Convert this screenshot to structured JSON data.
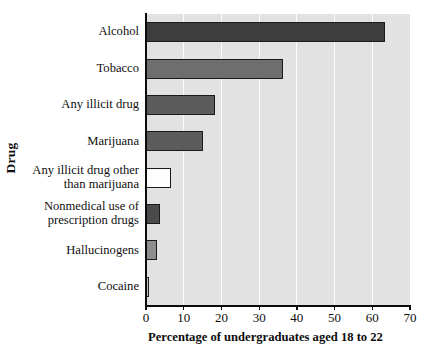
{
  "chart_data": {
    "type": "bar",
    "orientation": "horizontal",
    "title": "",
    "xlabel": "Percentage of undergraduates aged 18 to 22",
    "ylabel": "Drug",
    "xlim": [
      0,
      70
    ],
    "xticks": [
      0,
      10,
      20,
      30,
      40,
      50,
      60,
      70
    ],
    "xtick_labels": [
      "0",
      "10",
      "20",
      "30",
      "40",
      "50",
      "60",
      "70"
    ],
    "grid": "vertical",
    "legend": "none",
    "categories": [
      "Alcohol",
      "Tobacco",
      "Any illicit drug",
      "Marijuana",
      "Any illicit drug other than marijuana",
      "Nonmedical use of prescription drugs",
      "Hallucinogens",
      "Cocaine"
    ],
    "category_label_lines": [
      [
        "Alcohol"
      ],
      [
        "Tobacco"
      ],
      [
        "Any illicit drug"
      ],
      [
        "Marijuana"
      ],
      [
        "Any illicit drug other",
        "than marijuana"
      ],
      [
        "Nonmedical use of",
        "prescription drugs"
      ],
      [
        "Hallucinogens"
      ],
      [
        "Cocaine"
      ]
    ],
    "values": [
      63.3,
      36.2,
      18.4,
      15.0,
      6.6,
      3.7,
      2.9,
      0.8
    ],
    "bar_colors": [
      "#3d3d3d",
      "#6e6e6e",
      "#5c5c5c",
      "#5c5c5c",
      "#fdfdfd",
      "#4a4a4a",
      "#8e8e8e",
      "#c0c0c0"
    ],
    "bar_edge_color": "#1a1a1a",
    "plot_background": "#e2e2e2",
    "gridline_color": "#fbfbfb",
    "axis_color": "#0b0b0b"
  }
}
